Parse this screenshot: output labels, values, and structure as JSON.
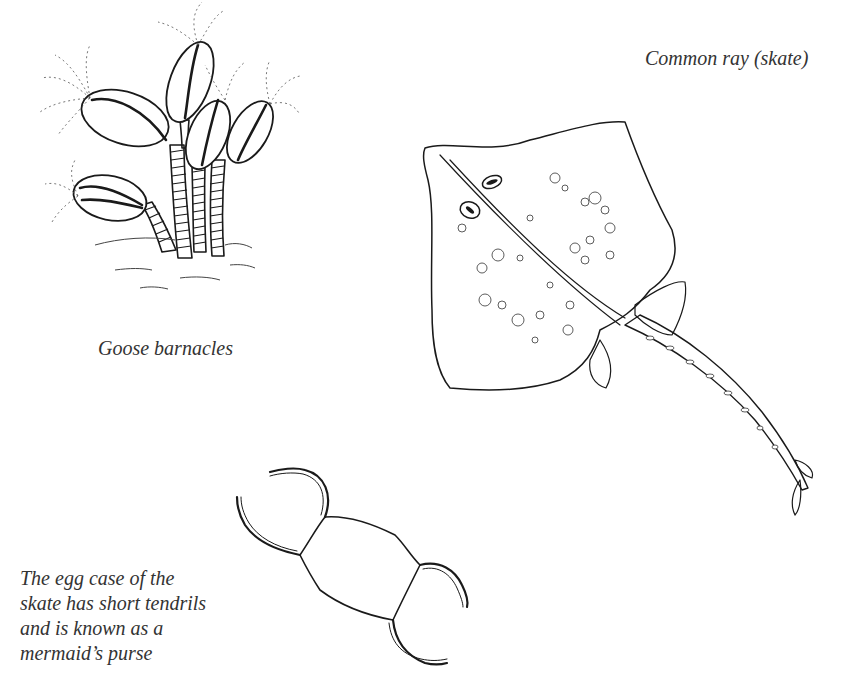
{
  "page": {
    "background": "#ffffff",
    "ink_color": "#1a1a1a"
  },
  "captions": {
    "ray": "Common ray (skate)",
    "barnacles": "Goose barnacles",
    "egg_case": [
      "The egg case of the",
      "skate has short tendrils",
      "and is known as a",
      "mermaid’s purse"
    ]
  },
  "figures": [
    {
      "id": "goose-barnacles",
      "label": "Goose barnacles illustration"
    },
    {
      "id": "common-ray",
      "label": "Common ray (skate) illustration"
    },
    {
      "id": "mermaids-purse",
      "label": "Skate egg case illustration"
    }
  ]
}
